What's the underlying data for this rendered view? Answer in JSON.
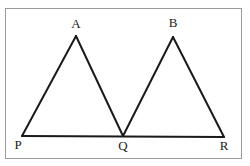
{
  "figure": {
    "background_color": "#ffffff",
    "frame": {
      "color": "#9a9a9a",
      "stroke_width": 1,
      "x": 5,
      "y": 8,
      "width": 236,
      "height": 150
    },
    "stroke_color": "#1a1a1a",
    "stroke_width": 2,
    "points": {
      "A": {
        "x": 76,
        "y": 36,
        "label": "A"
      },
      "B": {
        "x": 173,
        "y": 37,
        "label": "B"
      },
      "P": {
        "x": 22,
        "y": 136,
        "label": "P"
      },
      "Q": {
        "x": 123,
        "y": 136,
        "label": "Q"
      },
      "R": {
        "x": 224,
        "y": 137,
        "label": "R"
      }
    },
    "segments": [
      {
        "name": "PA",
        "from": "P",
        "to": "A"
      },
      {
        "name": "AQ",
        "from": "A",
        "to": "Q"
      },
      {
        "name": "QB",
        "from": "Q",
        "to": "B"
      },
      {
        "name": "BR",
        "from": "B",
        "to": "R"
      },
      {
        "name": "PR",
        "from": "P",
        "to": "R"
      }
    ],
    "labels": {
      "A": "A",
      "B": "B",
      "P": "P",
      "Q": "Q",
      "R": "R"
    }
  }
}
